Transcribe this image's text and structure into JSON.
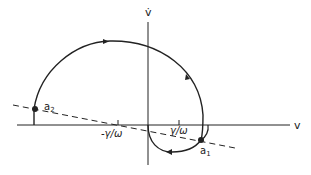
{
  "diagram": {
    "type": "phase-plane",
    "axes": {
      "x_label": "v",
      "y_label": "v̇"
    },
    "annotations": {
      "neg_gamma_omega": "-γ/ω",
      "pos_gamma_omega": "γ/ω"
    },
    "points": [
      {
        "id": "a2",
        "label": "a",
        "subscript": "2"
      },
      {
        "id": "a1",
        "label": "a",
        "subscript": "1"
      }
    ],
    "elements": {
      "trajectory": "spiral trajectory with direction arrows",
      "dashed_line": "switching line through a2 and a1"
    },
    "colors": {
      "ink": "#222222",
      "background": "#ffffff"
    }
  }
}
